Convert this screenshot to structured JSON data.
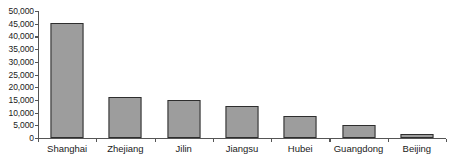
{
  "chart_data": {
    "type": "bar",
    "title": "",
    "subtitle": "",
    "xlabel": "",
    "ylabel": "",
    "categories": [
      "Shanghai",
      "Zhejiang",
      "Jilin",
      "Jiangsu",
      "Hubei",
      "Guangdong",
      "Beijing"
    ],
    "values": [
      45200,
      16000,
      15000,
      12500,
      8700,
      5300,
      1700
    ],
    "series": [
      {
        "name": "",
        "values": [
          45200,
          16000,
          15000,
          12500,
          8700,
          5300,
          1700
        ]
      }
    ],
    "ylim": [
      0,
      50000
    ],
    "ytick_values": [
      0,
      5000,
      10000,
      15000,
      20000,
      25000,
      30000,
      35000,
      40000,
      45000,
      50000
    ],
    "ytick_labels": [
      "0",
      "5,000",
      "10,000",
      "15,000",
      "20,000",
      "25,000",
      "30,000",
      "35,000",
      "40,000",
      "45,000",
      "50,000"
    ],
    "grid": false,
    "legend": false,
    "legend_position": "none",
    "bar_fill_color": "#9d9d9d",
    "bar_border_color": "#2e2e2e",
    "axis_color": "#555555",
    "text_color": "#1a1a1a",
    "background_color": "#ffffff"
  }
}
